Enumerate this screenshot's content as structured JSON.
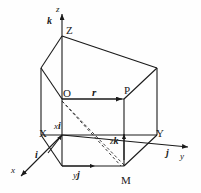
{
  "figure": {
    "background_color": "#fefefe",
    "stroke_color": "#1a1a1a",
    "axes": {
      "z": {
        "axis_label": "z",
        "unit_vector_label": "k"
      },
      "x": {
        "axis_label": "x",
        "unit_vector_label": "i"
      },
      "y": {
        "axis_label": "y",
        "unit_vector_label": "j"
      }
    },
    "vertices": {
      "z_point": "Z",
      "x_point": "X",
      "y_point": "Y",
      "origin": "O",
      "point_p": "P",
      "point_m": "M"
    },
    "vectors": {
      "position": "r",
      "x_component_scalar": "x",
      "x_component_unit": "i",
      "y_component_scalar": "y",
      "y_component_unit": "j",
      "z_component_scalar": "z",
      "z_component_unit": "k"
    }
  }
}
